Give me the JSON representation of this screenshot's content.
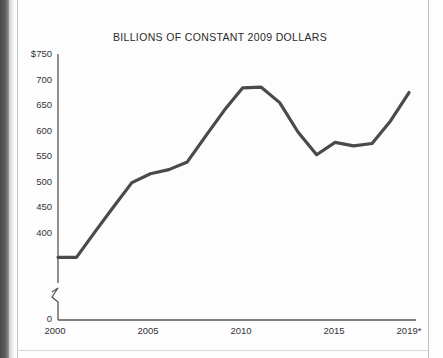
{
  "chart_data": {
    "type": "line",
    "title": "BILLIONS OF CONSTANT 2009 DOLLARS",
    "xlabel": "",
    "ylabel": "",
    "x": [
      2000,
      2001,
      2002,
      2003,
      2004,
      2005,
      2006,
      2007,
      2008,
      2009,
      2010,
      2011,
      2012,
      2013,
      2014,
      2015,
      2016,
      2017,
      2018,
      2019
    ],
    "values": [
      407,
      407,
      450,
      492,
      533,
      548,
      555,
      568,
      612,
      655,
      693,
      694,
      668,
      618,
      580,
      601,
      595,
      599,
      637,
      685
    ],
    "series": [
      {
        "name": "Billions of constant 2009 dollars",
        "values": [
          407,
          407,
          450,
          492,
          533,
          548,
          555,
          568,
          612,
          655,
          693,
          694,
          668,
          618,
          580,
          601,
          595,
          599,
          637,
          685
        ]
      }
    ],
    "ylim": [
      400,
      750
    ],
    "xlim": [
      2000,
      2019
    ],
    "y_ticks": [
      400,
      450,
      500,
      550,
      600,
      650,
      700,
      750
    ],
    "y_tick_labels": [
      "400",
      "450",
      "500",
      "550",
      "600",
      "650",
      "700",
      "$750"
    ],
    "x_ticks": [
      2000,
      2005,
      2010,
      2015,
      2019
    ],
    "x_tick_labels": [
      "2000",
      "2005",
      "2010",
      "2015",
      "2019*"
    ],
    "axis_break": true,
    "axis_break_label": "0",
    "grid": false,
    "legend": "none",
    "line_color": "#4a4a4a",
    "line_width": 3.2
  },
  "axis": {
    "y_labels": [
      "$750",
      "700",
      "650",
      "600",
      "550",
      "500",
      "450",
      "400"
    ],
    "zero_label": "0",
    "x_labels": [
      "2000",
      "2005",
      "2010",
      "2015",
      "2019*"
    ]
  },
  "colors": {
    "line": "#4a4a4a",
    "axis": "#555555",
    "text": "#33333a",
    "page": "#fdfdfd",
    "gutter": "#4a4a4a"
  }
}
